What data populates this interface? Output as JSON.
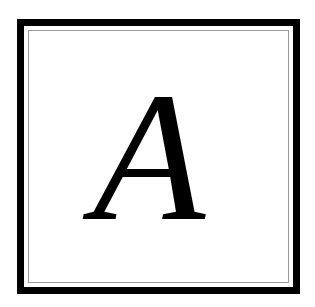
{
  "tile": {
    "letter": "A",
    "colors": {
      "background": "#ffffff",
      "outer_border": "#000000",
      "inner_border": "#9a9a9a",
      "letter": "#000000"
    }
  }
}
